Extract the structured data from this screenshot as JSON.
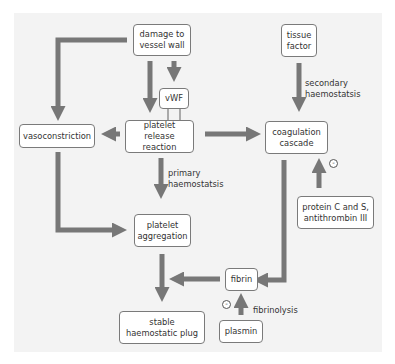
{
  "diagram": {
    "colors": {
      "arrow": "#777777",
      "panel": "#f3f3f3",
      "box_border": "#7a7a7a",
      "box_fill": "#ffffff"
    },
    "nodes": {
      "damage": "damage to vessel wall",
      "tissue_factor": "tissue factor",
      "vwf": "vWF",
      "platelet_release": "platelet release reaction",
      "vasoconstriction": "vasoconstriction",
      "coagulation": "coagulation cascade",
      "platelet_aggregation": "platelet aggregation",
      "protein_c": "protein C and S, antithrombin III",
      "fibrin": "fibrin",
      "stable_plug": "stable haemostatic plug",
      "plasmin": "plasmin"
    },
    "edge_labels": {
      "secondary": "secondary haemostatsis",
      "primary": "primary haemostatsis",
      "fibrinolysis": "fibrinolysis"
    },
    "inhibition_symbol": "-",
    "edges": [
      {
        "from": "damage to vessel wall",
        "to": "vasoconstriction"
      },
      {
        "from": "damage to vessel wall",
        "to": "platelet release reaction"
      },
      {
        "from": "damage to vessel wall",
        "to": "vWF"
      },
      {
        "from": "tissue factor",
        "to": "coagulation cascade",
        "label": "secondary haemostatsis"
      },
      {
        "from": "platelet release reaction",
        "to": "vasoconstriction"
      },
      {
        "from": "platelet release reaction",
        "to": "coagulation cascade"
      },
      {
        "from": "platelet release reaction",
        "to": "platelet aggregation",
        "label": "primary haemostatsis"
      },
      {
        "from": "vasoconstriction",
        "to": "platelet aggregation"
      },
      {
        "from": "protein C and S, antithrombin III",
        "to": "coagulation cascade",
        "type": "inhibit"
      },
      {
        "from": "coagulation cascade",
        "to": "fibrin"
      },
      {
        "from": "fibrin",
        "to": "stable haemostatic plug"
      },
      {
        "from": "platelet aggregation",
        "to": "stable haemostatic plug"
      },
      {
        "from": "plasmin",
        "to": "fibrin",
        "label": "fibrinolysis",
        "type": "inhibit"
      }
    ]
  }
}
